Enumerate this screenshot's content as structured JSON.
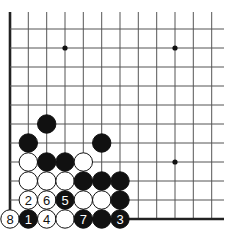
{
  "board": {
    "background": "#ffffff",
    "columns_x": [
      10,
      28.3,
      46.7,
      65,
      83.3,
      101.7,
      120,
      138.3,
      156.7,
      175,
      193.3,
      211.7
    ],
    "rows_y": [
      29,
      48,
      67,
      86,
      105,
      124,
      143,
      162,
      181,
      200,
      219
    ],
    "top_y": 12,
    "right_x": 224,
    "left_edge": true,
    "bottom_edge": true,
    "stone_radius": 9.2,
    "star_points": [
      {
        "col": 3,
        "row": 1
      },
      {
        "col": 9,
        "row": 1
      },
      {
        "col": 9,
        "row": 7
      }
    ]
  },
  "stones": [
    {
      "col": 2,
      "row": 5,
      "color": "black",
      "label": ""
    },
    {
      "col": 1,
      "row": 6,
      "color": "black",
      "label": ""
    },
    {
      "col": 5,
      "row": 6,
      "color": "black",
      "label": ""
    },
    {
      "col": 1,
      "row": 7,
      "color": "white",
      "label": ""
    },
    {
      "col": 2,
      "row": 7,
      "color": "black",
      "label": ""
    },
    {
      "col": 3,
      "row": 7,
      "color": "black",
      "label": ""
    },
    {
      "col": 4,
      "row": 7,
      "color": "white",
      "label": ""
    },
    {
      "col": 1,
      "row": 8,
      "color": "white",
      "label": ""
    },
    {
      "col": 2,
      "row": 8,
      "color": "white",
      "label": ""
    },
    {
      "col": 3,
      "row": 8,
      "color": "white",
      "label": ""
    },
    {
      "col": 4,
      "row": 8,
      "color": "black",
      "label": ""
    },
    {
      "col": 5,
      "row": 8,
      "color": "black",
      "label": ""
    },
    {
      "col": 6,
      "row": 8,
      "color": "black",
      "label": ""
    },
    {
      "col": 1,
      "row": 9,
      "color": "white",
      "label": "2"
    },
    {
      "col": 2,
      "row": 9,
      "color": "white",
      "label": "6"
    },
    {
      "col": 3,
      "row": 9,
      "color": "black",
      "label": "5"
    },
    {
      "col": 4,
      "row": 9,
      "color": "white",
      "label": ""
    },
    {
      "col": 5,
      "row": 9,
      "color": "white",
      "label": ""
    },
    {
      "col": 6,
      "row": 9,
      "color": "black",
      "label": ""
    },
    {
      "col": 0,
      "row": 10,
      "color": "white",
      "label": "8"
    },
    {
      "col": 1,
      "row": 10,
      "color": "black",
      "label": "1"
    },
    {
      "col": 2,
      "row": 10,
      "color": "white",
      "label": "4"
    },
    {
      "col": 3,
      "row": 10,
      "color": "white",
      "label": ""
    },
    {
      "col": 4,
      "row": 10,
      "color": "black",
      "label": "7"
    },
    {
      "col": 5,
      "row": 10,
      "color": "black",
      "label": ""
    },
    {
      "col": 6,
      "row": 10,
      "color": "black",
      "label": "3"
    }
  ]
}
